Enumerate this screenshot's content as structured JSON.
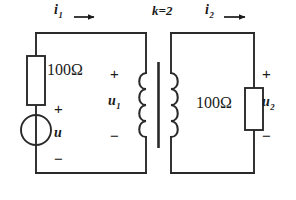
{
  "diagram": {
    "type": "electrical-schematic",
    "background_color": "#ffffff",
    "ink_color": "#1a1a1a"
  },
  "labels": {
    "current_primary": "i",
    "current_primary_sub": "1",
    "current_secondary": "i",
    "current_secondary_sub": "2",
    "coupling": "k=2",
    "resistor_primary": "100Ω",
    "resistor_secondary": "100Ω",
    "source_voltage": "u",
    "voltage_primary": "u",
    "voltage_primary_sub": "1",
    "voltage_secondary": "u",
    "voltage_secondary_sub": "2"
  },
  "polarity": {
    "source_plus": "+",
    "source_minus": "−",
    "u1_plus": "+",
    "u1_minus": "−",
    "u2_plus": "+",
    "u2_minus": "−"
  },
  "components": {
    "source": {
      "kind": "voltage-source",
      "symbol": "circle-with-bar"
    },
    "transformer": {
      "kind": "iron-core-transformer",
      "coupling_coefficient": "k=2",
      "primary_turns_drawn": 4,
      "secondary_turns_drawn": 4,
      "core_bars": 1
    },
    "resistors": [
      {
        "position": "primary-left-branch",
        "value": "100Ω"
      },
      {
        "position": "secondary-right-branch",
        "value": "100Ω"
      }
    ]
  },
  "arrows": {
    "primary_current_direction": "right",
    "secondary_current_direction": "right"
  }
}
